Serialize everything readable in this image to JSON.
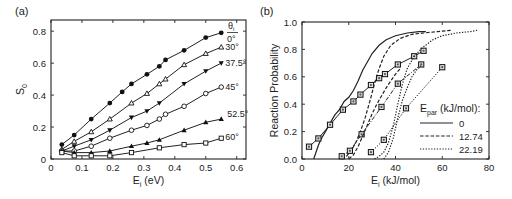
{
  "chart_data": [
    {
      "panel_label": "(a)",
      "type": "line",
      "title": "",
      "xlabel": "E_i (eV)",
      "xlabel_main": "E",
      "xlabel_sub": "i",
      "xlabel_rest": " (eV)",
      "ylabel": "S_0",
      "ylabel_main": "S",
      "ylabel_sub": "0",
      "xlim": [
        0,
        0.63
      ],
      "ylim": [
        0,
        0.87
      ],
      "xticks": [
        0,
        0.1,
        0.2,
        0.3,
        0.4,
        0.5,
        0.6
      ],
      "xtick_labels": [
        "0",
        "0.1",
        "0.2",
        "0.3",
        "0.4",
        "0.5",
        "0.6"
      ],
      "yticks": [
        0,
        0.2,
        0.4,
        0.6,
        0.8
      ],
      "ytick_labels": [
        "0",
        "0.2",
        "0.4",
        "0.6",
        "0.8"
      ],
      "grid": false,
      "legend_title": "θi",
      "legend_position": "right-inline-labels",
      "series": [
        {
          "name": "0°",
          "marker": "filled-circle",
          "x": [
            0.035,
            0.075,
            0.13,
            0.19,
            0.23,
            0.26,
            0.31,
            0.35,
            0.37,
            0.43,
            0.5,
            0.55
          ],
          "y": [
            0.09,
            0.15,
            0.25,
            0.35,
            0.42,
            0.47,
            0.53,
            0.58,
            0.62,
            0.68,
            0.76,
            0.79
          ]
        },
        {
          "name": "30°",
          "marker": "open-triangle-up",
          "x": [
            0.035,
            0.075,
            0.13,
            0.19,
            0.26,
            0.31,
            0.35,
            0.37,
            0.43,
            0.5,
            0.55
          ],
          "y": [
            0.06,
            0.11,
            0.17,
            0.25,
            0.35,
            0.41,
            0.47,
            0.5,
            0.59,
            0.66,
            0.7
          ]
        },
        {
          "name": "37.5°",
          "marker": "filled-triangle-down",
          "x": [
            0.035,
            0.075,
            0.13,
            0.19,
            0.26,
            0.31,
            0.35,
            0.43,
            0.5,
            0.55
          ],
          "y": [
            0.05,
            0.08,
            0.12,
            0.18,
            0.26,
            0.3,
            0.35,
            0.47,
            0.55,
            0.6
          ]
        },
        {
          "name": "45°",
          "marker": "open-circle",
          "x": [
            0.035,
            0.075,
            0.13,
            0.19,
            0.26,
            0.31,
            0.35,
            0.37,
            0.43,
            0.5,
            0.55
          ],
          "y": [
            0.05,
            0.05,
            0.08,
            0.13,
            0.18,
            0.21,
            0.25,
            0.28,
            0.33,
            0.41,
            0.45
          ]
        },
        {
          "name": "52.5°",
          "marker": "filled-triangle-up",
          "x": [
            0.035,
            0.075,
            0.13,
            0.19,
            0.26,
            0.31,
            0.35,
            0.43,
            0.5,
            0.55
          ],
          "y": [
            0.05,
            0.04,
            0.04,
            0.05,
            0.08,
            0.1,
            0.12,
            0.18,
            0.23,
            0.25
          ]
        },
        {
          "name": "60°",
          "marker": "open-square",
          "x": [
            0.035,
            0.075,
            0.13,
            0.19,
            0.26,
            0.35,
            0.43,
            0.5,
            0.55
          ],
          "y": [
            0.04,
            0.02,
            0.02,
            0.02,
            0.04,
            0.07,
            0.09,
            0.1,
            0.13
          ]
        }
      ]
    },
    {
      "panel_label": "(b)",
      "type": "line",
      "title": "",
      "xlabel": "E_i (kJ/mol)",
      "xlabel_main": "E",
      "xlabel_sub": "i",
      "xlabel_rest": " (kJ/mol)",
      "ylabel": "Reaction Probability",
      "xlim": [
        0,
        80
      ],
      "ylim": [
        0,
        1.0
      ],
      "xticks": [
        0,
        20,
        40,
        60,
        80
      ],
      "xtick_labels": [
        "0",
        "20",
        "40",
        "60",
        "80"
      ],
      "yticks": [
        0,
        0.2,
        0.4,
        0.6,
        0.8,
        1.0
      ],
      "ytick_labels": [
        "0.0",
        "0.2",
        "0.4",
        "0.6",
        "0.8",
        "1.0"
      ],
      "grid": false,
      "legend_title": "E_par (kJ/mol):",
      "legend_title_main": "E",
      "legend_title_sub": "par",
      "legend_title_rest": " (kJ/mol):",
      "legend_position": "lower-right",
      "legend": [
        {
          "label": "0",
          "style": "solid"
        },
        {
          "label": "12.74",
          "style": "dashed"
        },
        {
          "label": "22.19",
          "style": "dotted"
        }
      ],
      "series": [
        {
          "name": "0 (theory)",
          "style": "solid",
          "marker": "none",
          "x": [
            5,
            6,
            7,
            8,
            10,
            12,
            14,
            16,
            18,
            20,
            22,
            24,
            26,
            28,
            30,
            33,
            36,
            40,
            45,
            50,
            53
          ],
          "y": [
            0.0,
            0.05,
            0.1,
            0.14,
            0.2,
            0.26,
            0.32,
            0.36,
            0.42,
            0.45,
            0.5,
            0.57,
            0.65,
            0.71,
            0.77,
            0.83,
            0.87,
            0.9,
            0.92,
            0.93,
            0.93
          ]
        },
        {
          "name": "0 (exp)",
          "style": "solid",
          "marker": "open-square-dot",
          "x": [
            3,
            7,
            12,
            17.5,
            22,
            25,
            29.5,
            33,
            35.5,
            41,
            48,
            52
          ],
          "y": [
            0.09,
            0.15,
            0.25,
            0.36,
            0.42,
            0.47,
            0.54,
            0.59,
            0.62,
            0.69,
            0.75,
            0.79
          ]
        },
        {
          "name": "12.74 (theory)",
          "style": "dashed",
          "marker": "none",
          "x": [
            17,
            19,
            21,
            23,
            25,
            27,
            29,
            31,
            33,
            35,
            38,
            42,
            47,
            52,
            58,
            64
          ],
          "y": [
            0.0,
            0.02,
            0.06,
            0.12,
            0.2,
            0.3,
            0.42,
            0.55,
            0.66,
            0.75,
            0.83,
            0.88,
            0.91,
            0.92,
            0.93,
            0.94
          ]
        },
        {
          "name": "12.74 (exp)",
          "style": "dash-dot",
          "marker": "open-square-dot",
          "x": [
            17,
            20.5,
            25.5,
            34,
            41,
            51
          ],
          "y": [
            0.02,
            0.06,
            0.18,
            0.38,
            0.55,
            0.69
          ]
        },
        {
          "name": "12.74 (theory alt)",
          "style": "dashed",
          "marker": "none",
          "x": [
            20,
            22,
            24,
            26,
            28,
            30,
            32,
            34,
            36,
            38,
            40,
            42
          ],
          "y": [
            0.0,
            0.03,
            0.09,
            0.17,
            0.25,
            0.33,
            0.4,
            0.46,
            0.52,
            0.57,
            0.62,
            0.66
          ]
        },
        {
          "name": "22.19 (theory)",
          "style": "dotted",
          "marker": "none",
          "x": [
            31,
            33,
            35,
            37,
            39,
            41,
            43,
            45,
            48,
            52,
            56,
            60,
            66,
            72,
            75
          ],
          "y": [
            0.0,
            0.02,
            0.05,
            0.12,
            0.24,
            0.4,
            0.55,
            0.66,
            0.75,
            0.82,
            0.87,
            0.9,
            0.92,
            0.93,
            0.94
          ]
        },
        {
          "name": "22.19 (exp)",
          "style": "dotted",
          "marker": "open-square-dot",
          "x": [
            29.5,
            35,
            44.5,
            60
          ],
          "y": [
            0.05,
            0.14,
            0.37,
            0.67
          ]
        },
        {
          "name": "22.19 (theory alt)",
          "style": "dotted",
          "marker": "none",
          "x": [
            35,
            37,
            39,
            41,
            43,
            45,
            47,
            49,
            51
          ],
          "y": [
            0.0,
            0.05,
            0.15,
            0.3,
            0.43,
            0.52,
            0.6,
            0.65,
            0.68
          ]
        }
      ]
    }
  ]
}
